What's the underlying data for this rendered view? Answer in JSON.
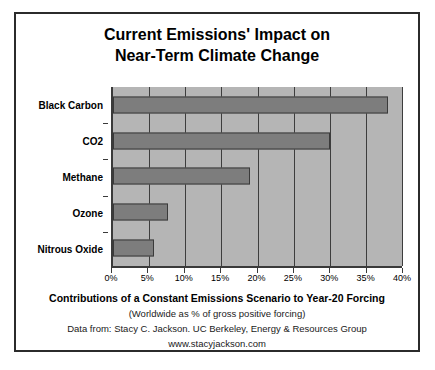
{
  "chart_data": {
    "type": "bar",
    "orientation": "horizontal",
    "title": "Current Emissions' Impact on Near-Term Climate Change",
    "title_lines": [
      "Current Emissions' Impact on",
      "Near-Term Climate Change"
    ],
    "categories": [
      "Black Carbon",
      "CO2",
      "Methane",
      "Ozone",
      "Nitrous Oxide"
    ],
    "values": [
      38,
      30,
      19,
      7.6,
      5.7
    ],
    "xlabel": "",
    "ylabel": "",
    "xlim": [
      0,
      40
    ],
    "ylim": null,
    "xtick_labels": [
      "0%",
      "5%",
      "10%",
      "15%",
      "20%",
      "25%",
      "30%",
      "35%",
      "40%"
    ],
    "xtick_values": [
      0,
      5,
      10,
      15,
      20,
      25,
      30,
      35,
      40
    ],
    "grid": true,
    "grid_axis": "x",
    "legend": null,
    "bar_color": "#7d7d7d",
    "bar_edge_color": "#3a3a3a",
    "plot_background": "#b5b5b5",
    "figure_background": "#ffffff",
    "frame_color": "#2b2b2b",
    "annotations": []
  },
  "footer": {
    "line1": "Contributions of a Constant Emissions Scenario to Year-20 Forcing",
    "line2": "(Worldwide as % of gross positive forcing)",
    "line3": "Data from: Stacy C. Jackson. UC Berkeley, Energy & Resources Group",
    "line4": "www.stacyjackson.com"
  }
}
